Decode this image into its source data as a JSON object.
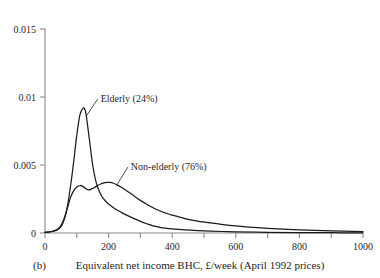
{
  "figure": {
    "panel_label": "(b)",
    "background_color": "#ffffff",
    "axis_color": "#8a8a8a",
    "curve_color": "#1a1a1a"
  },
  "chart_data": {
    "type": "line",
    "title": "",
    "subtitle": "",
    "xlabel": "Equivalent net income BHC, £/week (April 1992 prices)",
    "ylabel": "",
    "xlim": [
      0,
      1000
    ],
    "ylim": [
      0,
      0.015
    ],
    "grid": false,
    "legend_position": "inline-annotations",
    "xticks": [
      0,
      100,
      200,
      300,
      400,
      500,
      600,
      700,
      800,
      900,
      1000
    ],
    "xtick_labels": [
      "0",
      "",
      "200",
      "",
      "400",
      "",
      "600",
      "",
      "800",
      "",
      "1000"
    ],
    "yticks": [
      0,
      0.005,
      0.01,
      0.015
    ],
    "ytick_labels": [
      "0",
      "0.005",
      "0.01",
      "0.015"
    ],
    "annotations": [
      {
        "text": "Elderly (24%)",
        "x": 175,
        "y": 0.0097,
        "points_to_x": 130,
        "points_to_y": 0.0086
      },
      {
        "text": "Non-elderly (76%)",
        "x": 270,
        "y": 0.0047,
        "points_to_x": 225,
        "points_to_y": 0.0035
      }
    ],
    "series": [
      {
        "name": "Elderly (24%)",
        "share_percent": 24,
        "peak_x": 122,
        "peak_y": 0.0092,
        "x": [
          0,
          10,
          20,
          30,
          40,
          50,
          60,
          70,
          80,
          90,
          100,
          110,
          120,
          125,
          130,
          140,
          150,
          160,
          170,
          180,
          190,
          200,
          220,
          240,
          260,
          280,
          300,
          320,
          340,
          360,
          380,
          400,
          440,
          480,
          520,
          560,
          600,
          700,
          800,
          900,
          1000
        ],
        "y": [
          5e-05,
          7e-05,
          0.0001,
          0.00015,
          0.00025,
          0.00045,
          0.00095,
          0.0019,
          0.0034,
          0.0052,
          0.0072,
          0.0087,
          0.00918,
          0.0091,
          0.0086,
          0.0068,
          0.005,
          0.0038,
          0.0031,
          0.00265,
          0.00235,
          0.00213,
          0.00178,
          0.00152,
          0.00128,
          0.00106,
          0.00086,
          0.00068,
          0.00052,
          0.00042,
          0.00035,
          0.0003,
          0.00023,
          0.00018,
          0.00014,
          0.00011,
          9e-05,
          5e-05,
          3e-05,
          2e-05,
          1e-05
        ]
      },
      {
        "name": "Non-elderly (76%)",
        "share_percent": 76,
        "peak_x": 205,
        "peak_y": 0.0037,
        "x": [
          0,
          10,
          20,
          30,
          40,
          50,
          60,
          70,
          80,
          90,
          100,
          110,
          115,
          125,
          135,
          145,
          155,
          165,
          175,
          185,
          195,
          205,
          215,
          225,
          240,
          260,
          280,
          300,
          320,
          340,
          360,
          380,
          400,
          440,
          480,
          520,
          560,
          600,
          650,
          700,
          800,
          900,
          1000
        ],
        "y": [
          5e-05,
          7e-05,
          0.00011,
          0.00018,
          0.0003,
          0.00055,
          0.00105,
          0.0018,
          0.0026,
          0.0031,
          0.00338,
          0.00348,
          0.00348,
          0.00332,
          0.00318,
          0.00322,
          0.00334,
          0.00348,
          0.0036,
          0.00368,
          0.00372,
          0.00372,
          0.00366,
          0.00356,
          0.00336,
          0.00305,
          0.00272,
          0.0024,
          0.00211,
          0.00186,
          0.00164,
          0.00146,
          0.00131,
          0.00106,
          0.00088,
          0.00074,
          0.00062,
          0.00052,
          0.00042,
          0.00034,
          0.00023,
          0.00015,
          0.0001
        ]
      }
    ]
  }
}
